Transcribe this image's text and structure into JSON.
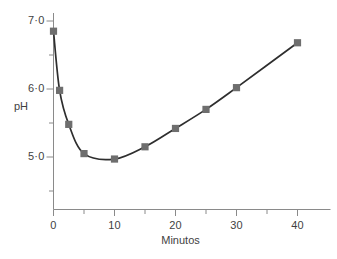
{
  "chart_data": {
    "type": "line",
    "title": "",
    "subtitle": "",
    "xlabel": "Minutos",
    "ylabel": "pH",
    "xlim": [
      0,
      44
    ],
    "ylim": [
      4.0,
      7.15
    ],
    "grid": false,
    "legend": null,
    "legend_position": "none",
    "marker": "square",
    "marker_color": "#6e6e6e",
    "line_color": "#2e2e2e",
    "axis_color": "#8a8a8a",
    "x_major_ticks": [
      0,
      10,
      20,
      30,
      40
    ],
    "x_major_tick_labels": [
      "0",
      "10",
      "20",
      "30",
      "40"
    ],
    "x_minor_ticks": [
      5,
      15,
      25,
      35
    ],
    "y_major_ticks": [
      5.0,
      6.0,
      7.0
    ],
    "y_major_tick_labels": [
      "5·0",
      "6·0",
      "7·0"
    ],
    "y_minor_ticks": [
      4.5,
      5.5,
      6.5
    ],
    "series": [
      {
        "name": "pH",
        "x": [
          0,
          1,
          2.5,
          5,
          10,
          15,
          20,
          25,
          30,
          40
        ],
        "values": [
          6.85,
          5.98,
          5.48,
          5.05,
          4.97,
          5.15,
          5.42,
          5.7,
          6.02,
          6.68
        ]
      }
    ]
  },
  "axes": {
    "x_title": "Minutos",
    "y_title": "pH"
  }
}
